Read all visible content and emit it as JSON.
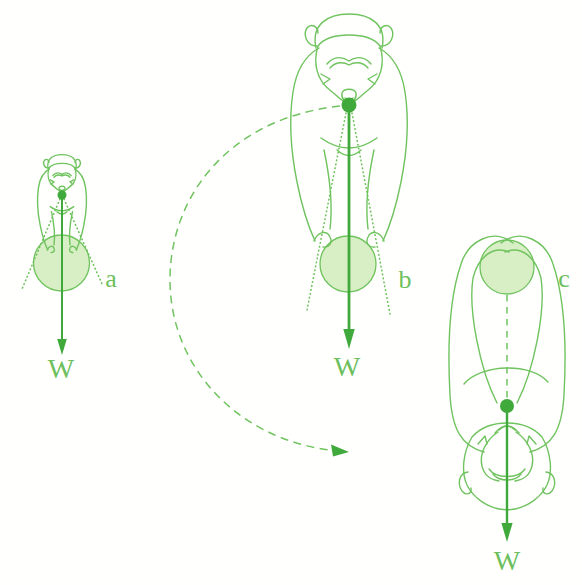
{
  "diagram": {
    "panels": [
      {
        "id": "a",
        "label": "a",
        "weight_label": "W"
      },
      {
        "id": "b",
        "label": "b",
        "weight_label": "W"
      },
      {
        "id": "c",
        "label": "c",
        "weight_label": "W"
      }
    ],
    "colors": {
      "line": "#70c35f",
      "fill": "#d8eec4",
      "strong": "#40a93b",
      "text": "#6dbf5d"
    }
  }
}
